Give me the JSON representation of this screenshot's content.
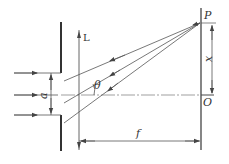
{
  "diagram": {
    "labels": {
      "lens": "L",
      "point_p": "P",
      "origin": "O",
      "distance_x": "x",
      "slit_width": "a",
      "angle": "θ",
      "focal_length": "f"
    },
    "colors": {
      "line": "#555555",
      "plate": "#333333",
      "background": "#ffffff"
    },
    "elements": [
      {
        "name": "slit-plate",
        "type": "opaque barrier with slit of width a"
      },
      {
        "name": "lens",
        "type": "thin convex lens L"
      },
      {
        "name": "screen",
        "type": "observation screen in focal plane"
      },
      {
        "name": "incident-rays",
        "count": 3,
        "direction": "left to right"
      },
      {
        "name": "diffracted-rays",
        "count": 3,
        "angle": "θ",
        "converge_at": "P"
      },
      {
        "name": "optical-axis",
        "style": "dash-dot"
      }
    ]
  }
}
